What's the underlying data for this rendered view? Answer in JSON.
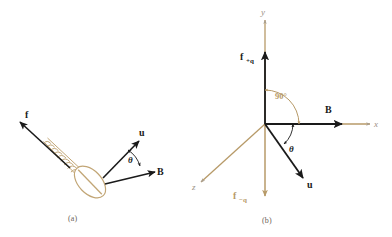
{
  "figure": {
    "background": "#ffffff"
  },
  "colors": {
    "vector_black": "#1a1a1a",
    "axis_tan": "#b79a68",
    "screw_tan": "#c2a676",
    "caption_gray": "#6b6258",
    "axis_label_gray": "#9b9183"
  },
  "panel_a": {
    "caption": "(a)",
    "labels": {
      "force": "f",
      "velocity": "u",
      "field": "B",
      "angle": "θ"
    },
    "elements": {
      "screw": "screw-illustration",
      "screw_head": "screw-head-ellipse",
      "screw_slot": "screw-head-slot",
      "threads": "screw-threads"
    },
    "vectors": [
      {
        "name": "f",
        "label": "f",
        "direction": "up-left",
        "color": "#1a1a1a"
      },
      {
        "name": "u",
        "label": "u",
        "direction": "up-right",
        "color": "#1a1a1a"
      },
      {
        "name": "B",
        "label": "B",
        "direction": "right",
        "color": "#1a1a1a"
      }
    ]
  },
  "panel_b": {
    "caption": "(b)",
    "axes": [
      {
        "name": "y",
        "label": "y",
        "direction": "up",
        "color": "#b79a68"
      },
      {
        "name": "x",
        "label": "x",
        "direction": "right",
        "color": "#b79a68"
      },
      {
        "name": "z",
        "label": "z",
        "direction": "down-left",
        "color": "#b79a68"
      }
    ],
    "vectors": [
      {
        "name": "f_plus_q",
        "label": "f",
        "subscript": "+q",
        "direction": "up",
        "color": "#1a1a1a"
      },
      {
        "name": "f_minus_q",
        "label": "f",
        "subscript": "−q",
        "direction": "down",
        "color": "#b79a68"
      },
      {
        "name": "B",
        "label": "B",
        "direction": "right",
        "color": "#1a1a1a"
      },
      {
        "name": "u",
        "label": "u",
        "direction": "down-right",
        "color": "#1a1a1a"
      }
    ],
    "angles": [
      {
        "name": "right-angle",
        "label": "90°",
        "between": "y-axis and x-axis",
        "color": "#b79a68"
      },
      {
        "name": "theta",
        "label": "θ",
        "between": "x-axis and u",
        "color": "#1a1a1a"
      }
    ]
  }
}
